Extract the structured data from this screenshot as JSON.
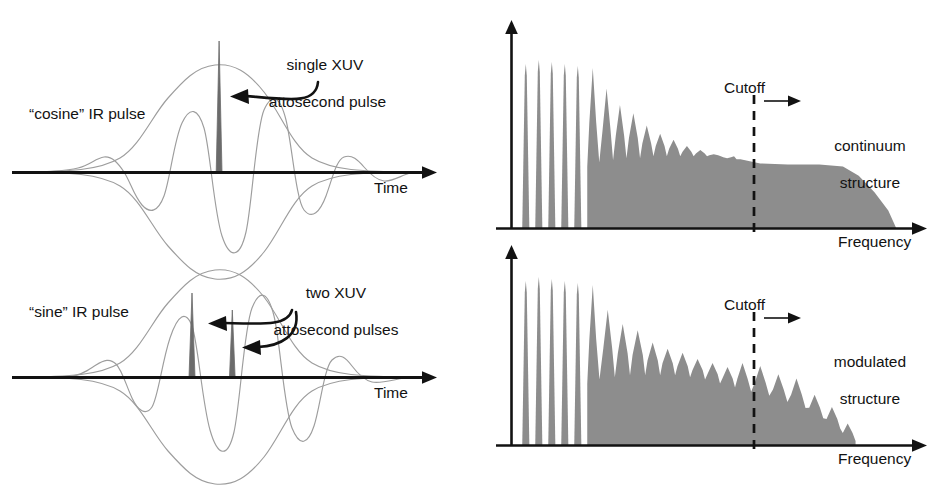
{
  "figure": {
    "title": "",
    "background": "#ffffff",
    "ink_color": "#121212",
    "spectrum_fill": "#8d8d8d",
    "pulse_line_color": "#9a9a9a",
    "xuv_fill": "#6e6e6e",
    "width": 952,
    "height": 495
  },
  "panels": {
    "top_left": {
      "name": "cosine-ir-pulse-panel",
      "pulse_label": "“cosine” IR pulse",
      "annotation": "single XUV\nattosecond pulse",
      "annotation_line1": "single XUV",
      "annotation_line2": "attosecond pulse",
      "axis_label": "Time",
      "xuv_pulse_count": 1
    },
    "bottom_left": {
      "name": "sine-ir-pulse-panel",
      "pulse_label": "“sine” IR pulse",
      "annotation": "two XUV\nattosecond pulses",
      "annotation_line1": "two XUV",
      "annotation_line2": "attosecond pulses",
      "axis_label": "Time",
      "xuv_pulse_count": 2
    },
    "top_right": {
      "name": "continuum-spectrum-panel",
      "cutoff_label": "Cutoff",
      "structure_line1": "continuum",
      "structure_line2": "structure",
      "axis_label": "Frequency"
    },
    "bottom_right": {
      "name": "modulated-spectrum-panel",
      "cutoff_label": "Cutoff",
      "structure_line1": "modulated",
      "structure_line2": "structure",
      "axis_label": "Frequency"
    }
  },
  "chart_data": [
    {
      "id": "top_left_waveform",
      "type": "line",
      "title": "“cosine” IR pulse with single XUV attosecond pulse",
      "xlabel": "Time",
      "ylabel": "",
      "carrier_phase": "cosine",
      "envelope": "gaussian",
      "carrier_cycles": 3.5,
      "xuv_peaks": [
        {
          "center": 0.0,
          "height": 1.72,
          "width": 0.035
        }
      ],
      "annotations": [
        "single XUV",
        "attosecond pulse"
      ]
    },
    {
      "id": "bottom_left_waveform",
      "type": "line",
      "title": "“sine” IR pulse with two XUV attosecond pulses",
      "xlabel": "Time",
      "ylabel": "",
      "carrier_phase": "sine",
      "envelope": "gaussian",
      "carrier_cycles": 3.5,
      "xuv_peaks": [
        {
          "center": -0.16,
          "height": 1.02,
          "width": 0.035
        },
        {
          "center": 0.1,
          "height": 0.8,
          "width": 0.035
        }
      ],
      "annotations": [
        "two XUV",
        "attosecond pulses"
      ]
    },
    {
      "id": "top_right_spectrum",
      "type": "area",
      "title": "High-harmonic spectrum: continuum structure",
      "xlabel": "Frequency",
      "ylabel": "",
      "grid": false,
      "cutoff_x": 0.58,
      "cutoff_label": "Cutoff",
      "region_label": "continuum structure",
      "discrete_harmonics": [
        {
          "x": 0.035,
          "height": 0.8,
          "width": 0.009,
          "base": 0.0
        },
        {
          "x": 0.068,
          "height": 0.82,
          "width": 0.009,
          "base": 0.0
        },
        {
          "x": 0.101,
          "height": 0.81,
          "width": 0.009,
          "base": 0.0
        },
        {
          "x": 0.134,
          "height": 0.8,
          "width": 0.009,
          "base": 0.0
        },
        {
          "x": 0.167,
          "height": 0.79,
          "width": 0.009,
          "base": 0.0
        }
      ],
      "plateau_harmonics": [
        {
          "x": 0.205,
          "height": 0.78,
          "width": 0.014,
          "base": 0.3
        },
        {
          "x": 0.24,
          "height": 0.68,
          "width": 0.016,
          "base": 0.32
        },
        {
          "x": 0.274,
          "height": 0.6,
          "width": 0.017,
          "base": 0.33
        },
        {
          "x": 0.308,
          "height": 0.56,
          "width": 0.018,
          "base": 0.34
        },
        {
          "x": 0.342,
          "height": 0.5,
          "width": 0.018,
          "base": 0.34
        },
        {
          "x": 0.376,
          "height": 0.46,
          "width": 0.018,
          "base": 0.35
        },
        {
          "x": 0.41,
          "height": 0.43,
          "width": 0.018,
          "base": 0.35
        },
        {
          "x": 0.444,
          "height": 0.4,
          "width": 0.018,
          "base": 0.35
        },
        {
          "x": 0.478,
          "height": 0.38,
          "width": 0.018,
          "base": 0.35
        },
        {
          "x": 0.512,
          "height": 0.36,
          "width": 0.018,
          "base": 0.35
        },
        {
          "x": 0.546,
          "height": 0.34,
          "width": 0.016,
          "base": 0.35
        },
        {
          "x": 0.578,
          "height": 0.335,
          "width": 0.013,
          "base": 0.335
        }
      ],
      "continuum_profile": [
        {
          "x": 0.58,
          "y": 0.335
        },
        {
          "x": 0.63,
          "y": 0.315
        },
        {
          "x": 0.7,
          "y": 0.31
        },
        {
          "x": 0.78,
          "y": 0.31
        },
        {
          "x": 0.84,
          "y": 0.3
        },
        {
          "x": 0.88,
          "y": 0.255
        },
        {
          "x": 0.92,
          "y": 0.175
        },
        {
          "x": 0.955,
          "y": 0.085
        },
        {
          "x": 0.975,
          "y": 0.0
        }
      ]
    },
    {
      "id": "bottom_right_spectrum",
      "type": "area",
      "title": "High-harmonic spectrum: modulated structure",
      "xlabel": "Frequency",
      "ylabel": "",
      "grid": false,
      "cutoff_x": 0.58,
      "cutoff_label": "Cutoff",
      "region_label": "modulated structure",
      "discrete_harmonics": [
        {
          "x": 0.035,
          "height": 0.8,
          "width": 0.009,
          "base": 0.0
        },
        {
          "x": 0.068,
          "height": 0.82,
          "width": 0.009,
          "base": 0.0
        },
        {
          "x": 0.101,
          "height": 0.81,
          "width": 0.009,
          "base": 0.0
        },
        {
          "x": 0.134,
          "height": 0.8,
          "width": 0.009,
          "base": 0.0
        },
        {
          "x": 0.167,
          "height": 0.79,
          "width": 0.009,
          "base": 0.0
        }
      ],
      "plateau_harmonics": [
        {
          "x": 0.205,
          "height": 0.78,
          "width": 0.014,
          "base": 0.3
        },
        {
          "x": 0.243,
          "height": 0.66,
          "width": 0.018,
          "base": 0.32
        },
        {
          "x": 0.281,
          "height": 0.59,
          "width": 0.02,
          "base": 0.33
        },
        {
          "x": 0.319,
          "height": 0.56,
          "width": 0.021,
          "base": 0.34
        },
        {
          "x": 0.357,
          "height": 0.5,
          "width": 0.021,
          "base": 0.34
        },
        {
          "x": 0.395,
          "height": 0.47,
          "width": 0.021,
          "base": 0.34
        },
        {
          "x": 0.433,
          "height": 0.45,
          "width": 0.021,
          "base": 0.33
        },
        {
          "x": 0.471,
          "height": 0.42,
          "width": 0.021,
          "base": 0.32
        },
        {
          "x": 0.509,
          "height": 0.4,
          "width": 0.021,
          "base": 0.3
        },
        {
          "x": 0.547,
          "height": 0.38,
          "width": 0.021,
          "base": 0.28
        },
        {
          "x": 0.585,
          "height": 0.4,
          "width": 0.021,
          "base": 0.26
        },
        {
          "x": 0.63,
          "height": 0.385,
          "width": 0.022,
          "base": 0.24
        },
        {
          "x": 0.676,
          "height": 0.345,
          "width": 0.022,
          "base": 0.21
        },
        {
          "x": 0.722,
          "height": 0.325,
          "width": 0.022,
          "base": 0.18
        },
        {
          "x": 0.768,
          "height": 0.245,
          "width": 0.022,
          "base": 0.13
        },
        {
          "x": 0.812,
          "height": 0.185,
          "width": 0.022,
          "base": 0.08
        },
        {
          "x": 0.852,
          "height": 0.105,
          "width": 0.02,
          "base": 0.02
        }
      ]
    }
  ]
}
